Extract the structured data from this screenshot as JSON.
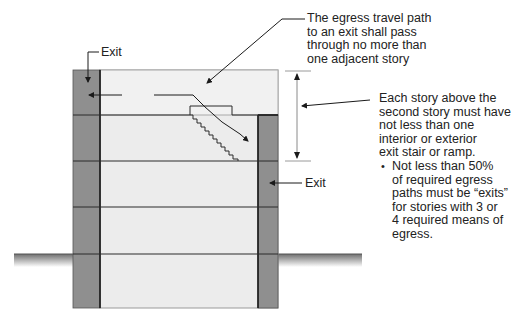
{
  "diagram": {
    "type": "building-section-egress",
    "colors": {
      "building_fill": "#ececec",
      "exit_fill": "#8f8f8f",
      "lines": "#2a2a2a",
      "ground": "#7a7a7a",
      "dimension": "#9a9a9a"
    },
    "labels": {
      "exit_left": "Exit",
      "exit_right": "Exit",
      "travel_path_note": {
        "lines": [
          "The egress travel path",
          "to an exit shall pass",
          "through no more than",
          "one adjacent story"
        ]
      },
      "story_note": {
        "lines": [
          "Each story above the",
          "second story must have",
          "not less than one",
          "interior or exterior",
          "exit stair or ramp."
        ]
      },
      "bullet_note": {
        "bullet": "•",
        "lines": [
          "Not less than 50%",
          "of required egress",
          "paths must be “exits”",
          "for stories with 3 or",
          "4 required means of",
          "egress."
        ]
      }
    },
    "stories": 5
  }
}
